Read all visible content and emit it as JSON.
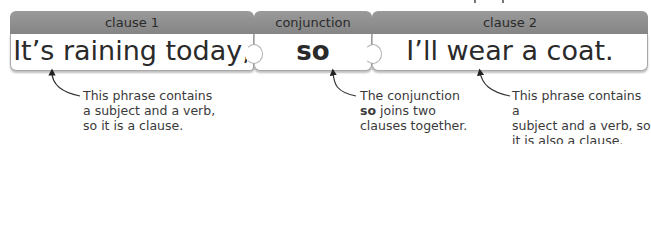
{
  "diagram": {
    "title": "",
    "pieces": [
      {
        "header": "clause 1",
        "text": "It’s raining today,"
      },
      {
        "header": "conjunction",
        "text": "so"
      },
      {
        "header": "clause 2",
        "text": "I’ll wear a coat."
      }
    ],
    "annotations": [
      {
        "lines": [
          "This phrase contains",
          "a subject and a verb,",
          "so it is a clause."
        ]
      },
      {
        "line1": "The conjunction",
        "line2_bold": "so",
        "line2_rest": " joins two",
        "line3": "clauses together."
      },
      {
        "lines": [
          "This phrase contains a",
          "subject and a verb, so",
          "it is also a clause."
        ]
      }
    ],
    "colors": {
      "header_bg": "#8f8f8f",
      "body_bg": "#ffffff",
      "text": "#2a2a2a"
    }
  }
}
